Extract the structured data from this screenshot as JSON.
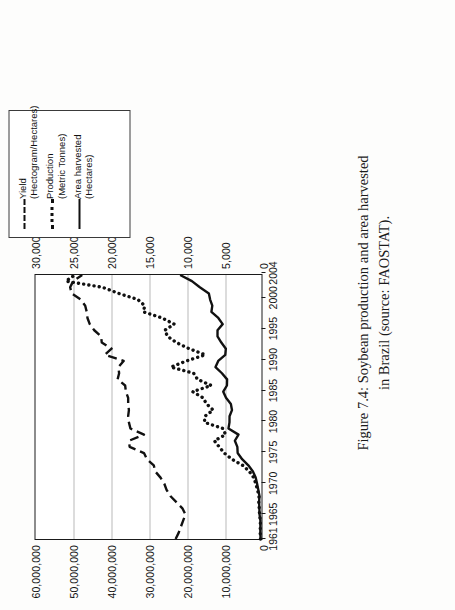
{
  "figure": {
    "caption_line1": "Figure 7.4: Soybean production and area harvested",
    "caption_line2": "in Brazil (source: FAOSTAT)."
  },
  "legend": {
    "items": [
      {
        "name": "Yield",
        "unit": "(Hectogram/Hectares)",
        "style": "dashed"
      },
      {
        "name": "Production",
        "unit": "(Metric Tonnes)",
        "style": "dotted"
      },
      {
        "name": "Area harvested",
        "unit": "(Hectares)",
        "style": "solid"
      }
    ]
  },
  "chart_data": {
    "type": "line",
    "title": "Soybean production and area harvested in Brazil",
    "xlabel": "",
    "ylabel": "",
    "grid": true,
    "legend_position": "right",
    "x": [
      1961,
      1962,
      1963,
      1964,
      1965,
      1966,
      1967,
      1968,
      1969,
      1970,
      1971,
      1972,
      1973,
      1974,
      1975,
      1976,
      1977,
      1978,
      1979,
      1980,
      1981,
      1982,
      1983,
      1984,
      1985,
      1986,
      1987,
      1988,
      1989,
      1990,
      1991,
      1992,
      1993,
      1994,
      1995,
      1996,
      1997,
      1998,
      1999,
      2000,
      2001,
      2002,
      2003,
      2004
    ],
    "xticklabels": [
      "1961",
      "1965",
      "1970",
      "1975",
      "1980",
      "1985",
      "1990",
      "1995",
      "2000",
      "2004"
    ],
    "xtickvalues": [
      1961,
      1965,
      1970,
      1975,
      1980,
      1985,
      1990,
      1995,
      2000,
      2004
    ],
    "primary_axis": {
      "label": "",
      "ticklabels": [
        "0",
        "10,000,000",
        "20,000,000",
        "30,000,000",
        "40,000,000",
        "50,000,000",
        "60,000,000"
      ],
      "tickvalues": [
        0,
        10000000,
        20000000,
        30000000,
        40000000,
        50000000,
        60000000
      ],
      "ylim": [
        0,
        60000000
      ]
    },
    "secondary_axis": {
      "label": "",
      "ticklabels": [
        "0",
        "5,000",
        "10,000",
        "15,000",
        "20,000",
        "25,000",
        "30,000"
      ],
      "tickvalues": [
        0,
        5000,
        10000,
        15000,
        20000,
        25000,
        30000
      ],
      "ylim": [
        0,
        30000
      ]
    },
    "series": [
      {
        "name": "Yield (Hectogram/Hectares)",
        "axis": "secondary",
        "style": "dashed",
        "values": [
          11400,
          11000,
          10700,
          10400,
          10100,
          10500,
          11300,
          12100,
          12600,
          12900,
          13400,
          14100,
          14300,
          15200,
          15600,
          17500,
          17600,
          15600,
          17400,
          17600,
          17700,
          17600,
          17700,
          17700,
          18000,
          18100,
          19100,
          18900,
          19000,
          18300,
          20800,
          19900,
          21200,
          21300,
          22200,
          22800,
          23100,
          23200,
          23400,
          24000,
          25200,
          25400,
          25000,
          23800
        ]
      },
      {
        "name": "Production (Metric Tonnes)",
        "axis": "primary",
        "style": "dotted",
        "values": [
          271000,
          345000,
          322000,
          305000,
          523000,
          595000,
          716000,
          654000,
          1057000,
          1509000,
          2077000,
          3223000,
          5012000,
          7876000,
          9893000,
          11227000,
          12513000,
          9541000,
          10240000,
          15156000,
          15007000,
          12836000,
          14582000,
          15541000,
          18278000,
          13333000,
          16977000,
          18011000,
          24072000,
          19897000,
          14937000,
          19214000,
          22590000,
          24931000,
          25682000,
          23189000,
          26392000,
          31370000,
          30987000,
          32820000,
          37907000,
          42230000,
          51919000,
          49549000
        ]
      },
      {
        "name": "Area harvested (Hectares)",
        "axis": "primary",
        "style": "solid",
        "values": [
          240000,
          313000,
          301000,
          293000,
          517000,
          567000,
          633000,
          539000,
          839000,
          1169000,
          1549000,
          2276000,
          3501000,
          5144000,
          6329000,
          6411000,
          7070000,
          6113000,
          8774000,
          8501000,
          8485000,
          7837000,
          8135000,
          9421000,
          10153000,
          9180000,
          9134000,
          10502000,
          12204000,
          11487000,
          9617000,
          9467000,
          10663000,
          11679000,
          11675000,
          10306000,
          11466000,
          13304000,
          13061000,
          13640000,
          13970000,
          16376000,
          18475000,
          21601000
        ]
      }
    ]
  }
}
